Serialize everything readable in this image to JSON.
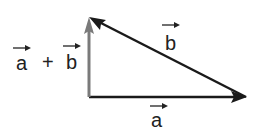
{
  "diagram": {
    "type": "vector-triangle",
    "colors": {
      "a": "#1a1a1a",
      "b": "#1a1a1a",
      "sum": "#7a7a7a"
    },
    "vectors": [
      {
        "id": "a",
        "label": "a",
        "from": [
          89,
          97
        ],
        "to": [
          246,
          97
        ]
      },
      {
        "id": "b",
        "label": "b",
        "from": [
          246,
          97
        ],
        "to": [
          89,
          17
        ]
      },
      {
        "id": "sum",
        "label": "a + b",
        "from": [
          89,
          97
        ],
        "to": [
          89,
          17
        ]
      }
    ],
    "labels": {
      "a": "a",
      "b": "b",
      "sum_a": "a",
      "plus": "+",
      "sum_b": "b"
    }
  }
}
